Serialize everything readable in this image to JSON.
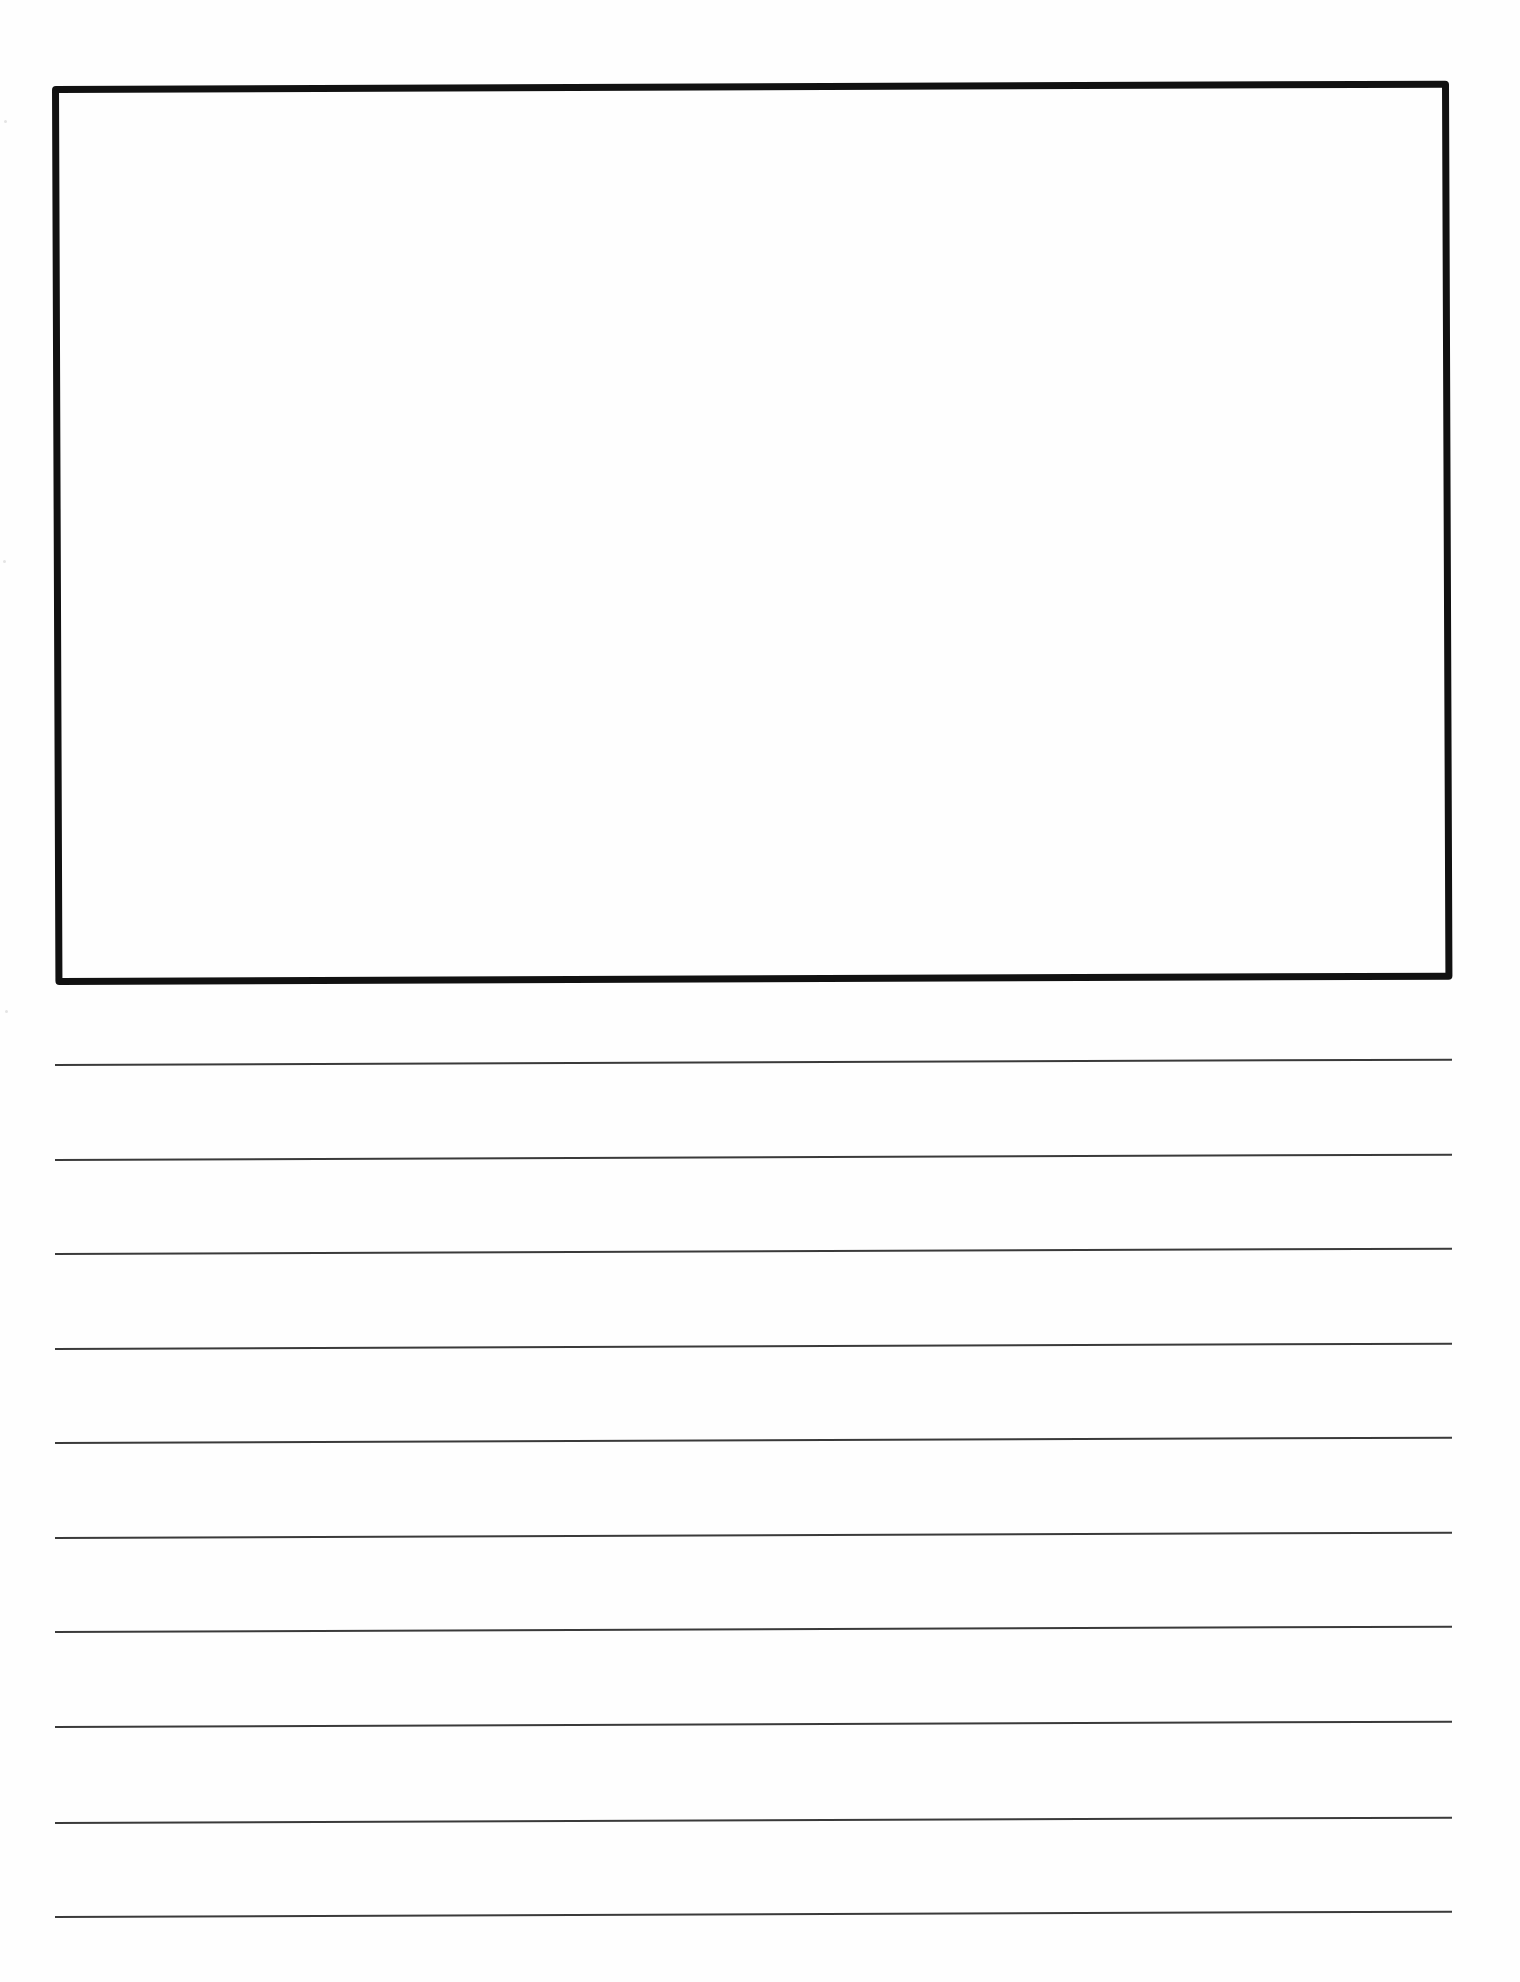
{
  "page": {
    "type": "primary writing paper",
    "background": "#ffffff",
    "ink_color": "#111111"
  },
  "drawing_box": {
    "label": "",
    "border_color": "#111111"
  },
  "writing_lines": {
    "count": 10,
    "line_color": "#3a3a3a",
    "lines": [
      {
        "index": 1,
        "text": ""
      },
      {
        "index": 2,
        "text": ""
      },
      {
        "index": 3,
        "text": ""
      },
      {
        "index": 4,
        "text": ""
      },
      {
        "index": 5,
        "text": ""
      },
      {
        "index": 6,
        "text": ""
      },
      {
        "index": 7,
        "text": ""
      },
      {
        "index": 8,
        "text": ""
      },
      {
        "index": 9,
        "text": ""
      },
      {
        "index": 10,
        "text": ""
      }
    ]
  }
}
